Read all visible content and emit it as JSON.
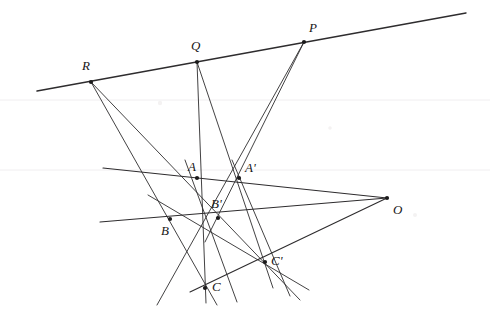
{
  "figure": {
    "width": 490,
    "height": 335,
    "background_color": "#ffffff",
    "ink_color": "#2e2c2e",
    "rule_color": "#f0eef0",
    "points": [
      {
        "id": "R",
        "label": "R",
        "x": 91,
        "y": 82,
        "label_x": 82,
        "label_y": 70,
        "dot": true
      },
      {
        "id": "Q",
        "label": "Q",
        "x": 197,
        "y": 62,
        "label_x": 191,
        "label_y": 50,
        "dot": true
      },
      {
        "id": "P",
        "label": "P",
        "x": 304,
        "y": 42,
        "label_x": 309,
        "label_y": 32,
        "dot": true
      },
      {
        "id": "A",
        "label": "A",
        "x": 197,
        "y": 178,
        "label_x": 188,
        "label_y": 171,
        "dot": true
      },
      {
        "id": "Ap",
        "label": "A'",
        "x": 239,
        "y": 178,
        "label_x": 245,
        "label_y": 172,
        "dot": true
      },
      {
        "id": "B",
        "label": "B",
        "x": 170,
        "y": 219,
        "label_x": 161,
        "label_y": 235,
        "dot": true
      },
      {
        "id": "Bp",
        "label": "B'",
        "x": 218,
        "y": 218,
        "label_x": 211,
        "label_y": 208,
        "dot": true
      },
      {
        "id": "C",
        "label": "C",
        "x": 205,
        "y": 288,
        "label_x": 212,
        "label_y": 291,
        "dot": true
      },
      {
        "id": "Cp",
        "label": "C'",
        "x": 265,
        "y": 262,
        "label_x": 271,
        "label_y": 265,
        "dot": true
      },
      {
        "id": "O",
        "label": "O",
        "x": 387,
        "y": 198,
        "label_x": 393,
        "label_y": 214,
        "dot": true
      }
    ],
    "ruled_lines": [
      {
        "name": "paper-rule-upper",
        "y": 100
      },
      {
        "name": "paper-rule-lower",
        "y": 170
      }
    ],
    "segments": [
      {
        "name": "axis-line-PQR",
        "x1": 37,
        "y1": 91,
        "x2": 466,
        "y2": 13,
        "weight": "bold"
      },
      {
        "name": "line-R-to-Cp",
        "x1": 91,
        "y1": 82,
        "x2": 300,
        "y2": 300,
        "weight": "thin"
      },
      {
        "name": "line-R-to-C",
        "x1": 91,
        "y1": 82,
        "x2": 217,
        "y2": 305,
        "weight": "thin"
      },
      {
        "name": "line-Q-through-A-C",
        "x1": 197,
        "y1": 62,
        "x2": 206,
        "y2": 303,
        "weight": "thin"
      },
      {
        "name": "line-Q-to-Cp",
        "x1": 197,
        "y1": 62,
        "x2": 273,
        "y2": 288,
        "weight": "thin"
      },
      {
        "name": "line-P-to-B",
        "x1": 304,
        "y1": 42,
        "x2": 157,
        "y2": 305,
        "weight": "thin"
      },
      {
        "name": "line-P-to-Bp",
        "x1": 304,
        "y1": 42,
        "x2": 205,
        "y2": 242,
        "weight": "thin"
      },
      {
        "name": "line-O-to-A-left",
        "x1": 387,
        "y1": 198,
        "x2": 103,
        "y2": 168,
        "weight": "med"
      },
      {
        "name": "line-O-to-B-left",
        "x1": 387,
        "y1": 198,
        "x2": 100,
        "y2": 222,
        "weight": "med"
      },
      {
        "name": "line-O-to-C",
        "x1": 387,
        "y1": 198,
        "x2": 190,
        "y2": 292,
        "weight": "med"
      },
      {
        "name": "side-A-to-C",
        "x1": 185,
        "y1": 160,
        "x2": 237,
        "y2": 302,
        "weight": "thin"
      },
      {
        "name": "side-Ap-to-Cp",
        "x1": 232,
        "y1": 160,
        "x2": 290,
        "y2": 296,
        "weight": "thin"
      },
      {
        "name": "side-B-to-Cp-ext",
        "x1": 148,
        "y1": 195,
        "x2": 309,
        "y2": 290,
        "weight": "thin"
      }
    ]
  }
}
